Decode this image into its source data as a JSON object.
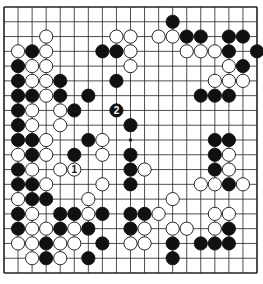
{
  "diagram": {
    "board_size": 19,
    "geometry": {
      "left": 4,
      "top": 7,
      "right": 257,
      "bottom": 273,
      "stone_radius": 6.6
    },
    "colors": {
      "background": "#ffffff",
      "line": "#222222",
      "black_stone": "#111111",
      "white_stone": "#ffffff",
      "stone_outline": "#111111"
    },
    "star_points": [
      [
        9,
        9
      ]
    ],
    "stones": [
      {
        "c": 12,
        "r": 1,
        "color": "B"
      },
      {
        "c": 3,
        "r": 2,
        "color": "W"
      },
      {
        "c": 8,
        "r": 2,
        "color": "W"
      },
      {
        "c": 9,
        "r": 2,
        "color": "W"
      },
      {
        "c": 11,
        "r": 2,
        "color": "W"
      },
      {
        "c": 12,
        "r": 2,
        "color": "W"
      },
      {
        "c": 13,
        "r": 2,
        "color": "B"
      },
      {
        "c": 14,
        "r": 2,
        "color": "B"
      },
      {
        "c": 16,
        "r": 2,
        "color": "B"
      },
      {
        "c": 17,
        "r": 2,
        "color": "B"
      },
      {
        "c": 1,
        "r": 3,
        "color": "W"
      },
      {
        "c": 2,
        "r": 3,
        "color": "B"
      },
      {
        "c": 3,
        "r": 3,
        "color": "W"
      },
      {
        "c": 7,
        "r": 3,
        "color": "B"
      },
      {
        "c": 8,
        "r": 3,
        "color": "B"
      },
      {
        "c": 9,
        "r": 3,
        "color": "W"
      },
      {
        "c": 13,
        "r": 3,
        "color": "W"
      },
      {
        "c": 14,
        "r": 3,
        "color": "W"
      },
      {
        "c": 15,
        "r": 3,
        "color": "W"
      },
      {
        "c": 16,
        "r": 3,
        "color": "B"
      },
      {
        "c": 18,
        "r": 3,
        "color": "B"
      },
      {
        "c": 1,
        "r": 4,
        "color": "B"
      },
      {
        "c": 2,
        "r": 4,
        "color": "W"
      },
      {
        "c": 3,
        "r": 4,
        "color": "W"
      },
      {
        "c": 9,
        "r": 4,
        "color": "W"
      },
      {
        "c": 16,
        "r": 4,
        "color": "W"
      },
      {
        "c": 17,
        "r": 4,
        "color": "B"
      },
      {
        "c": 1,
        "r": 5,
        "color": "B"
      },
      {
        "c": 2,
        "r": 5,
        "color": "W"
      },
      {
        "c": 3,
        "r": 5,
        "color": "W"
      },
      {
        "c": 4,
        "r": 5,
        "color": "B"
      },
      {
        "c": 8,
        "r": 5,
        "color": "B"
      },
      {
        "c": 15,
        "r": 5,
        "color": "W"
      },
      {
        "c": 16,
        "r": 5,
        "color": "W"
      },
      {
        "c": 17,
        "r": 5,
        "color": "W"
      },
      {
        "c": 1,
        "r": 6,
        "color": "B"
      },
      {
        "c": 2,
        "r": 6,
        "color": "B"
      },
      {
        "c": 3,
        "r": 6,
        "color": "W"
      },
      {
        "c": 4,
        "r": 6,
        "color": "B"
      },
      {
        "c": 6,
        "r": 6,
        "color": "B"
      },
      {
        "c": 14,
        "r": 6,
        "color": "B"
      },
      {
        "c": 15,
        "r": 6,
        "color": "B"
      },
      {
        "c": 16,
        "r": 6,
        "color": "B"
      },
      {
        "c": 1,
        "r": 7,
        "color": "B"
      },
      {
        "c": 2,
        "r": 7,
        "color": "W"
      },
      {
        "c": 4,
        "r": 7,
        "color": "W"
      },
      {
        "c": 5,
        "r": 7,
        "color": "B"
      },
      {
        "c": 8,
        "r": 7,
        "color": "B",
        "label": "2"
      },
      {
        "c": 1,
        "r": 8,
        "color": "B"
      },
      {
        "c": 2,
        "r": 8,
        "color": "W"
      },
      {
        "c": 4,
        "r": 8,
        "color": "W"
      },
      {
        "c": 9,
        "r": 8,
        "color": "B"
      },
      {
        "c": 1,
        "r": 9,
        "color": "B"
      },
      {
        "c": 2,
        "r": 9,
        "color": "B"
      },
      {
        "c": 3,
        "r": 9,
        "color": "W"
      },
      {
        "c": 6,
        "r": 9,
        "color": "B"
      },
      {
        "c": 7,
        "r": 9,
        "color": "W"
      },
      {
        "c": 15,
        "r": 9,
        "color": "B"
      },
      {
        "c": 16,
        "r": 9,
        "color": "B"
      },
      {
        "c": 1,
        "r": 10,
        "color": "W"
      },
      {
        "c": 2,
        "r": 10,
        "color": "B"
      },
      {
        "c": 3,
        "r": 10,
        "color": "W"
      },
      {
        "c": 5,
        "r": 10,
        "color": "B"
      },
      {
        "c": 7,
        "r": 10,
        "color": "W"
      },
      {
        "c": 9,
        "r": 10,
        "color": "B"
      },
      {
        "c": 15,
        "r": 10,
        "color": "B"
      },
      {
        "c": 16,
        "r": 10,
        "color": "W"
      },
      {
        "c": 1,
        "r": 11,
        "color": "B"
      },
      {
        "c": 2,
        "r": 11,
        "color": "W"
      },
      {
        "c": 4,
        "r": 11,
        "color": "W"
      },
      {
        "c": 5,
        "r": 11,
        "color": "W",
        "label": "1"
      },
      {
        "c": 9,
        "r": 11,
        "color": "B"
      },
      {
        "c": 10,
        "r": 11,
        "color": "W"
      },
      {
        "c": 15,
        "r": 11,
        "color": "B"
      },
      {
        "c": 16,
        "r": 11,
        "color": "W"
      },
      {
        "c": 1,
        "r": 12,
        "color": "B"
      },
      {
        "c": 2,
        "r": 12,
        "color": "B"
      },
      {
        "c": 3,
        "r": 12,
        "color": "W"
      },
      {
        "c": 7,
        "r": 12,
        "color": "W"
      },
      {
        "c": 9,
        "r": 12,
        "color": "B"
      },
      {
        "c": 14,
        "r": 12,
        "color": "W"
      },
      {
        "c": 15,
        "r": 12,
        "color": "W"
      },
      {
        "c": 16,
        "r": 12,
        "color": "B"
      },
      {
        "c": 17,
        "r": 12,
        "color": "W"
      },
      {
        "c": 1,
        "r": 13,
        "color": "W"
      },
      {
        "c": 2,
        "r": 13,
        "color": "B"
      },
      {
        "c": 3,
        "r": 13,
        "color": "B"
      },
      {
        "c": 6,
        "r": 13,
        "color": "W"
      },
      {
        "c": 12,
        "r": 13,
        "color": "W"
      },
      {
        "c": 1,
        "r": 14,
        "color": "B"
      },
      {
        "c": 2,
        "r": 14,
        "color": "W"
      },
      {
        "c": 4,
        "r": 14,
        "color": "B"
      },
      {
        "c": 5,
        "r": 14,
        "color": "B"
      },
      {
        "c": 6,
        "r": 14,
        "color": "W"
      },
      {
        "c": 7,
        "r": 14,
        "color": "B"
      },
      {
        "c": 9,
        "r": 14,
        "color": "B"
      },
      {
        "c": 10,
        "r": 14,
        "color": "B"
      },
      {
        "c": 11,
        "r": 14,
        "color": "W"
      },
      {
        "c": 15,
        "r": 14,
        "color": "W"
      },
      {
        "c": 16,
        "r": 14,
        "color": "W"
      },
      {
        "c": 1,
        "r": 15,
        "color": "B"
      },
      {
        "c": 2,
        "r": 15,
        "color": "W"
      },
      {
        "c": 3,
        "r": 15,
        "color": "W"
      },
      {
        "c": 4,
        "r": 15,
        "color": "B"
      },
      {
        "c": 5,
        "r": 15,
        "color": "W"
      },
      {
        "c": 6,
        "r": 15,
        "color": "B"
      },
      {
        "c": 9,
        "r": 15,
        "color": "B"
      },
      {
        "c": 10,
        "r": 15,
        "color": "W"
      },
      {
        "c": 12,
        "r": 15,
        "color": "W"
      },
      {
        "c": 13,
        "r": 15,
        "color": "W"
      },
      {
        "c": 15,
        "r": 15,
        "color": "W"
      },
      {
        "c": 16,
        "r": 15,
        "color": "B"
      },
      {
        "c": 1,
        "r": 16,
        "color": "W"
      },
      {
        "c": 2,
        "r": 16,
        "color": "W"
      },
      {
        "c": 3,
        "r": 16,
        "color": "B"
      },
      {
        "c": 4,
        "r": 16,
        "color": "W"
      },
      {
        "c": 5,
        "r": 16,
        "color": "W"
      },
      {
        "c": 7,
        "r": 16,
        "color": "B"
      },
      {
        "c": 9,
        "r": 16,
        "color": "W"
      },
      {
        "c": 10,
        "r": 16,
        "color": "W"
      },
      {
        "c": 12,
        "r": 16,
        "color": "B"
      },
      {
        "c": 14,
        "r": 16,
        "color": "B"
      },
      {
        "c": 15,
        "r": 16,
        "color": "B"
      },
      {
        "c": 16,
        "r": 16,
        "color": "B"
      },
      {
        "c": 2,
        "r": 17,
        "color": "W"
      },
      {
        "c": 3,
        "r": 17,
        "color": "B"
      },
      {
        "c": 4,
        "r": 17,
        "color": "W"
      },
      {
        "c": 6,
        "r": 17,
        "color": "B"
      },
      {
        "c": 12,
        "r": 17,
        "color": "B"
      }
    ],
    "move_labels": [
      {
        "label": "1",
        "color": "W",
        "c": 5,
        "r": 11
      },
      {
        "label": "2",
        "color": "B",
        "c": 8,
        "r": 7
      }
    ]
  }
}
